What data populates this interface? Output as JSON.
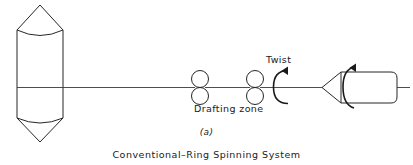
{
  "figure": {
    "caption": "Conventional–Ring Spinning System",
    "subfigure_label": "(a)",
    "background_color": "#ffffff",
    "line_color": "#262626"
  },
  "labels": {
    "twist": "Twist",
    "drafting_zone": "Drafting zone"
  },
  "components": {
    "roving_package": {
      "name": "roving-package",
      "shape": "cylinder-with-conical-ends"
    },
    "yarn_line": {
      "name": "yarn-path"
    },
    "drafting_rollers": [
      {
        "name": "roller-pair-back"
      },
      {
        "name": "roller-pair-front"
      }
    ],
    "twist_arrow": {
      "name": "twist-rotation-arrow",
      "direction": "clockwise"
    },
    "yarn_bobbin": {
      "name": "yarn-bobbin-package",
      "shape": "cone-tipped-cylinder"
    },
    "bobbin_rotation_arrow": {
      "name": "bobbin-rotation-arrow",
      "direction": "clockwise"
    }
  }
}
